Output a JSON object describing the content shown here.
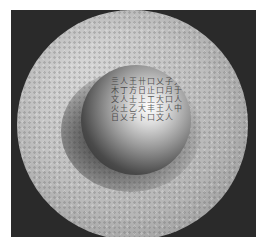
{
  "image": {
    "description": "Photograph of a round bronze dish with a raised central boss bearing an engraved inscription, on a dark background",
    "background_color": "#2a2a2a",
    "border_color": "#ffffff",
    "dish_color": "#bdbdbd",
    "boss_highlight_color": "#ffffff",
    "inscription_text": "亖人王卄口乂子大木丁方日止口月于文人士上工大口人火土乙大丰王人中日乂子卜口文人"
  }
}
